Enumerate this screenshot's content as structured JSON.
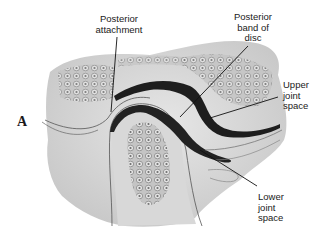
{
  "figure": {
    "panel_label": "A",
    "labels": {
      "posterior_attachment": [
        "Posterior",
        "attachment"
      ],
      "posterior_band": [
        "Posterior",
        "band of",
        "disc"
      ],
      "upper_joint_space": [
        "Upper",
        "joint",
        "space"
      ],
      "lower_joint_space": [
        "Lower",
        "joint",
        "space"
      ]
    },
    "colors": {
      "tissue": "#d2d2d2",
      "tissue_light": "#e4e4e4",
      "disc": "#1e1e1e",
      "bone_cells": "#8a8a8a",
      "text": "#1a1a1a",
      "background": "#ffffff"
    }
  }
}
